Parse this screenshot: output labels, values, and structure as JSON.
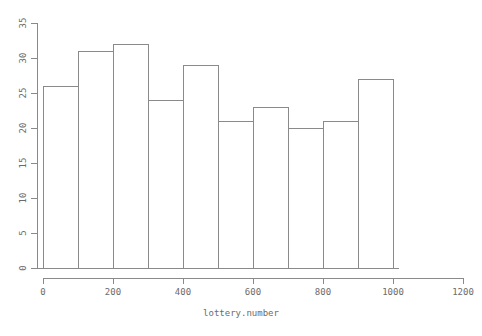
{
  "chart_data": {
    "type": "bar",
    "title": "",
    "subtitle": "",
    "xlabel": "lottery.number",
    "ylabel": "",
    "categories": [
      "0-100",
      "100-200",
      "200-300",
      "300-400",
      "400-500",
      "500-600",
      "600-700",
      "700-800",
      "800-900",
      "900-1000"
    ],
    "bin_edges": [
      0,
      100,
      200,
      300,
      400,
      500,
      600,
      700,
      800,
      900,
      1000
    ],
    "values": [
      26,
      31,
      32,
      24,
      29,
      21,
      23,
      20,
      21,
      27
    ],
    "xlim": [
      0,
      1200
    ],
    "ylim": [
      0,
      35
    ],
    "xticks": [
      0,
      200,
      400,
      600,
      800,
      1000,
      1200
    ],
    "yticks": [
      0,
      5,
      10,
      15,
      20,
      25,
      30,
      35
    ],
    "xtick_labels": [
      "0",
      "200",
      "400",
      "600",
      "800",
      "1000",
      "1200"
    ],
    "ytick_labels": [
      "0",
      "5",
      "10",
      "15",
      "20",
      "25",
      "30",
      "35"
    ],
    "grid": false,
    "legend": null,
    "legend_position": "none",
    "bar_fill_color": "#ffffff",
    "bar_stroke_color": "#8a8a8a",
    "axis_color": "#8a8a8a",
    "text_color": "#6b6b6b",
    "background_color": "#ffffff",
    "ylabel_rotated": true,
    "ytick_labels_rotated": true
  }
}
